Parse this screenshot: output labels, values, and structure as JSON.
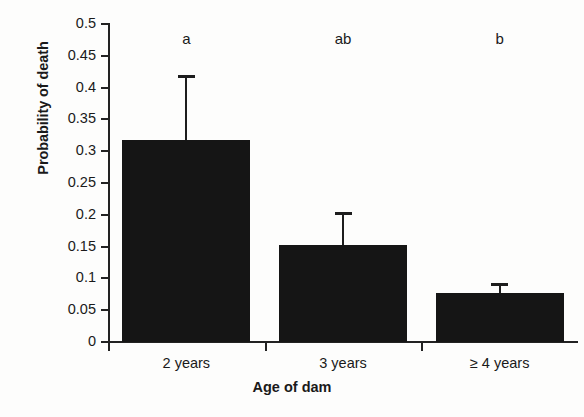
{
  "chart_data": {
    "type": "bar",
    "title": "",
    "xlabel": "Age of dam",
    "ylabel": "Probability of death",
    "categories": [
      "2 years",
      "3 years",
      "≥ 4 years"
    ],
    "values": [
      0.317,
      0.152,
      0.077
    ],
    "errors": [
      0.103,
      0.053,
      0.015
    ],
    "error_type": "upper-only",
    "annotations": [
      "a",
      "ab",
      "b"
    ],
    "ylim": [
      0,
      0.5
    ],
    "yticks": [
      0,
      0.05,
      0.1,
      0.15,
      0.2,
      0.25,
      0.3,
      0.35,
      0.4,
      0.45,
      0.5
    ],
    "ytick_labels": [
      "0",
      "0.05",
      "0.1",
      "0.15",
      "0.2",
      "0.25",
      "0.3",
      "0.35",
      "0.4",
      "0.45",
      "0.5"
    ],
    "grid": false,
    "legend": null,
    "bar_color": "#151515",
    "axis_color": "#222222",
    "background": "#fdfdfc"
  }
}
